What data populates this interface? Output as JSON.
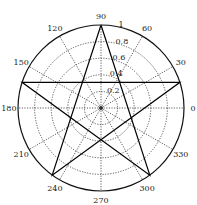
{
  "chart_data": {
    "type": "polar",
    "title": "",
    "theta_unit": "degrees",
    "angular_ticks": [
      0,
      30,
      60,
      90,
      120,
      150,
      180,
      210,
      240,
      270,
      300,
      330
    ],
    "angular_tick_labels": [
      "0",
      "30",
      "60",
      "90",
      "120",
      "150",
      "180",
      "210",
      "240",
      "270",
      "300",
      "330"
    ],
    "radial_ticks": [
      0.2,
      0.4,
      0.6,
      0.8,
      1
    ],
    "radial_tick_labels": [
      "0.2",
      "0.4",
      "0.6",
      "0.8",
      "1"
    ],
    "rlim": [
      0,
      1
    ],
    "grid": true,
    "grid_style": "dotted",
    "series": [
      {
        "name": "pentagram",
        "theta": [
          90,
          306,
          162,
          18,
          234,
          90
        ],
        "r": [
          1,
          1,
          1,
          1,
          1,
          1
        ],
        "color": "#000000"
      }
    ]
  }
}
